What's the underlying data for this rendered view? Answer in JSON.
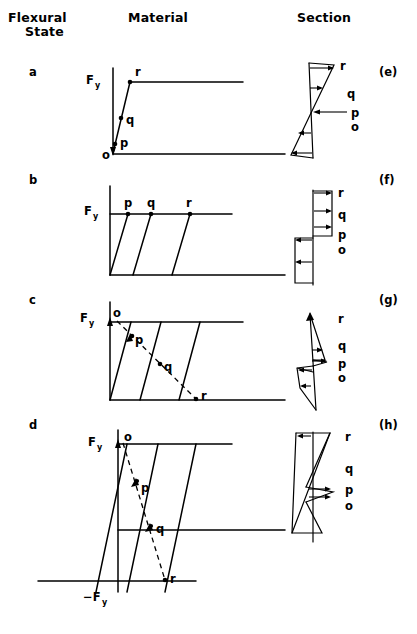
{
  "figure": {
    "headers": [
      {
        "id": "flexural-state",
        "line1": "Flexural",
        "line2": "State"
      },
      {
        "id": "material",
        "line1": "Material",
        "line2": ""
      },
      {
        "id": "section",
        "line1": "Section",
        "line2": ""
      }
    ],
    "row_labels": [
      "a",
      "b",
      "c",
      "d"
    ],
    "panel_tags": [
      "(e)",
      "(f)",
      "(g)",
      "(h)"
    ],
    "axis_labels": {
      "fy": "F",
      "fy_sub": "y",
      "neg_fy": "−F",
      "neg_fy_sub": "y"
    },
    "point_labels": {
      "o": "o",
      "p": "p",
      "q": "q",
      "r": "r"
    },
    "rows": [
      {
        "id": "row-a",
        "row_label": "a",
        "panel_tag": "(e)",
        "material_points": [
          "r",
          "q",
          "p",
          "o"
        ],
        "section_points": [
          "r",
          "q",
          "p",
          "o"
        ],
        "description": "elastic: single loading line to first yield"
      },
      {
        "id": "row-b",
        "row_label": "b",
        "panel_tag": "(f)",
        "material_points": [
          "p",
          "q",
          "r"
        ],
        "section_points": [
          "r",
          "q",
          "p",
          "o"
        ],
        "description": "yield plateau: three parallel loading lines at Fy"
      },
      {
        "id": "row-c",
        "row_label": "c",
        "panel_tag": "(g)",
        "material_points": [
          "o",
          "p",
          "q",
          "r"
        ],
        "section_points": [
          "r",
          "q",
          "p",
          "o"
        ],
        "description": "unloading: dashed line from o to r across three parallel lines"
      },
      {
        "id": "row-d",
        "row_label": "d",
        "panel_tag": "(h)",
        "material_points": [
          "o",
          "p",
          "q",
          "r"
        ],
        "section_points": [
          "r",
          "q",
          "p",
          "o"
        ],
        "description": "reversed loading to -Fy with dashed unloading path"
      }
    ],
    "colors": {
      "ink": "#000000",
      "background": "#ffffff"
    }
  }
}
